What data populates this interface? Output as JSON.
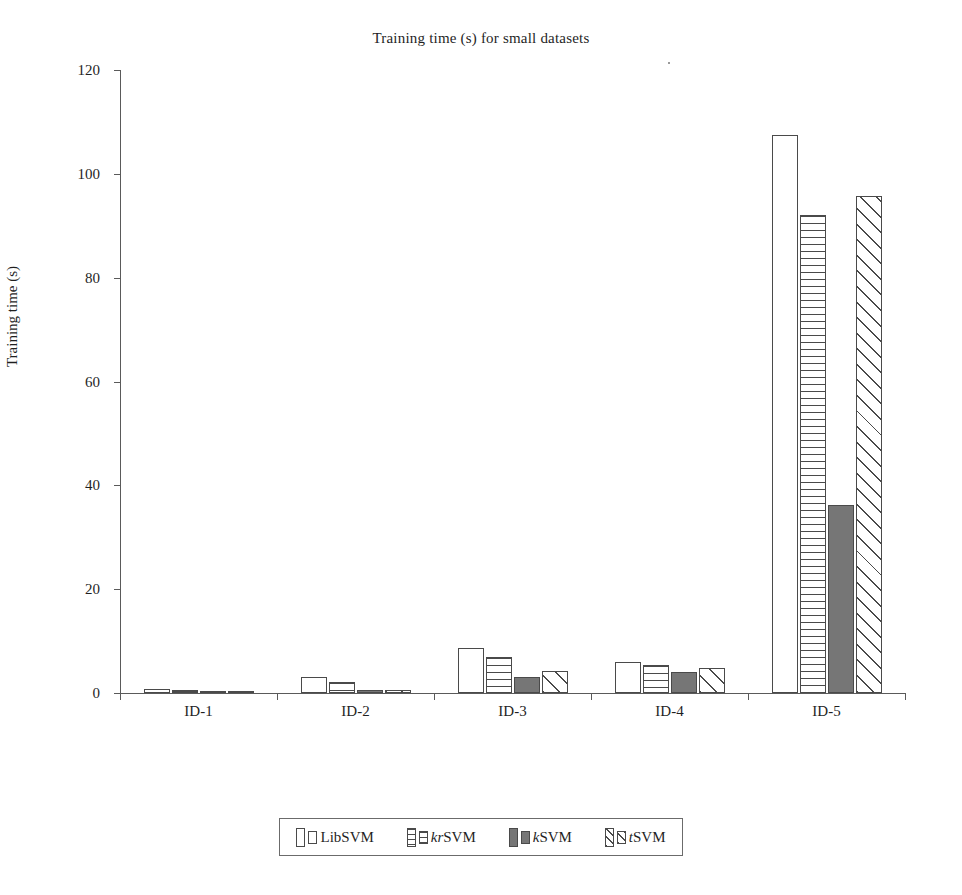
{
  "chart_data": {
    "type": "bar",
    "title": "Training time (s) for small datasets",
    "xlabel": "",
    "ylabel": "Training time (s)",
    "ylim": [
      0,
      120
    ],
    "yticks": [
      0,
      20,
      40,
      60,
      80,
      100,
      120
    ],
    "grid": false,
    "legend_position": "bottom",
    "categories": [
      "ID-1",
      "ID-2",
      "ID-3",
      "ID-4",
      "ID-5"
    ],
    "series": [
      {
        "name": "LibSVM",
        "pattern": "empty",
        "color": "#ffffff",
        "values": [
          0.8,
          3.0,
          8.6,
          6.0,
          107.5
        ]
      },
      {
        "name": "krSVM",
        "pattern": "hlines",
        "color": "#ffffff",
        "values": [
          0.5,
          2.1,
          7.0,
          5.3,
          92.0
        ]
      },
      {
        "name": "kSVM",
        "pattern": "solid",
        "color": "#767676",
        "values": [
          0.3,
          0.6,
          3.0,
          4.0,
          36.2
        ]
      },
      {
        "name": "tSVM",
        "pattern": "diag",
        "color": "#ffffff",
        "values": [
          0.3,
          0.6,
          4.2,
          4.8,
          95.8
        ]
      }
    ]
  },
  "legend": {
    "entries": [
      {
        "label_prefix": "",
        "label_italic": "",
        "label_rest": "LibSVM",
        "pattern": "empty"
      },
      {
        "label_prefix": "",
        "label_italic": "kr",
        "label_rest": "SVM",
        "pattern": "hlines"
      },
      {
        "label_prefix": "",
        "label_italic": "k",
        "label_rest": "SVM",
        "pattern": "solid"
      },
      {
        "label_prefix": "",
        "label_italic": "t",
        "label_rest": "SVM",
        "pattern": "diag"
      }
    ]
  }
}
